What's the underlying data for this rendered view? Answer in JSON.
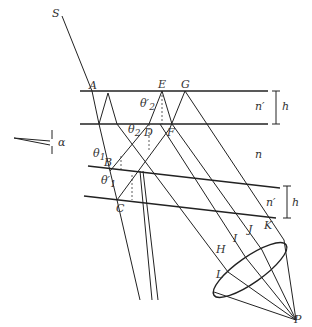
{
  "diagram": {
    "type": "optics-thin-film-interference",
    "points": {
      "S": "S",
      "A": "A",
      "B": "B",
      "C": "C",
      "D": "D",
      "E": "E",
      "F": "F",
      "G": "G",
      "H": "H",
      "I": "I",
      "J": "J",
      "K": "K",
      "L": "L",
      "P": "P"
    },
    "angles": {
      "theta1": "θ",
      "theta1_sub": "1",
      "theta1p": "θ′",
      "theta1p_sub": "1",
      "theta2": "θ",
      "theta2_sub": "2",
      "theta2p": "θ′",
      "theta2p_sub": "2",
      "alpha": "α"
    },
    "media": {
      "top_film": "n′",
      "middle": "n",
      "bottom_film": "n′"
    },
    "dimensions": {
      "top_thickness": "h",
      "bottom_thickness": "h"
    }
  }
}
